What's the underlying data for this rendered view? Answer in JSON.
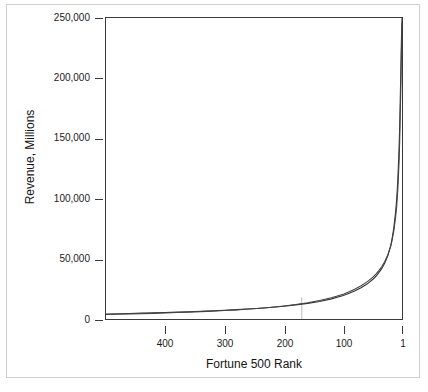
{
  "chart_data": {
    "type": "line",
    "title": "",
    "xlabel": "Fortune 500 Rank",
    "ylabel": "Revenue, Millions",
    "xlim": [
      500,
      1
    ],
    "ylim": [
      0,
      250000
    ],
    "x_reversed": true,
    "grid": false,
    "legend": "none",
    "xticks": [
      400,
      300,
      200,
      100,
      1
    ],
    "xtick_labels": [
      "400",
      "300",
      "200",
      "100",
      "1"
    ],
    "yticks": [
      0,
      50000,
      100000,
      150000,
      200000,
      250000
    ],
    "ytick_labels": [
      "0",
      "50,000",
      "100,000",
      "150,000",
      "200,000",
      "250,000"
    ],
    "annotations": [
      {
        "name": "rank-marker",
        "type": "vertical-drop-line",
        "x": 170,
        "y_from": 0,
        "y_to": 18000
      }
    ],
    "series": [
      {
        "name": "series-1",
        "color": "#333333",
        "x": [
          500,
          480,
          460,
          440,
          420,
          400,
          380,
          360,
          340,
          320,
          300,
          280,
          260,
          240,
          220,
          200,
          180,
          160,
          140,
          120,
          100,
          90,
          80,
          70,
          60,
          50,
          45,
          40,
          35,
          30,
          25,
          20,
          18,
          15,
          12,
          10,
          8,
          6,
          5,
          4,
          3,
          2,
          1
        ],
        "y": [
          4200,
          4400,
          4600,
          4850,
          5100,
          5400,
          5700,
          6050,
          6400,
          6800,
          7250,
          7750,
          8300,
          8950,
          9700,
          10600,
          11700,
          13000,
          14600,
          16700,
          19500,
          21300,
          23400,
          25900,
          29000,
          33000,
          35500,
          38500,
          42000,
          46500,
          52500,
          61000,
          66000,
          75000,
          88000,
          99000,
          116000,
          141000,
          158000,
          181000,
          205000,
          232000,
          250000
        ]
      },
      {
        "name": "series-2",
        "color": "#444444",
        "x": [
          500,
          480,
          460,
          440,
          420,
          400,
          380,
          360,
          340,
          320,
          300,
          280,
          260,
          240,
          220,
          200,
          180,
          160,
          140,
          120,
          100,
          90,
          80,
          70,
          60,
          50,
          45,
          40,
          35,
          30,
          25,
          20,
          18,
          15,
          12,
          10,
          8,
          6,
          5,
          4,
          3,
          2,
          1
        ],
        "y": [
          3700,
          3900,
          4150,
          4400,
          4700,
          5000,
          5350,
          5700,
          6100,
          6550,
          7050,
          7600,
          8250,
          8950,
          9800,
          10800,
          12000,
          13500,
          15300,
          17600,
          20600,
          22600,
          24900,
          27600,
          30800,
          34800,
          37300,
          40200,
          43600,
          47800,
          53200,
          60500,
          64800,
          72500,
          83500,
          93000,
          108000,
          130000,
          146000,
          168000,
          192000,
          220000,
          246000
        ]
      }
    ]
  },
  "axis": {
    "ylabel": "Revenue, Millions",
    "xlabel": "Fortune 500 Rank"
  },
  "caption": {
    "bottom_fragment": ""
  }
}
